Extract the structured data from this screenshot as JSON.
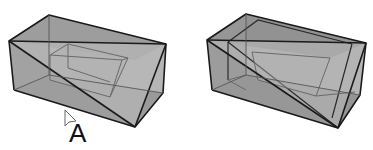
{
  "figure": {
    "panels": [
      {
        "id": "left",
        "label": "A",
        "has_cursor": true
      },
      {
        "id": "right",
        "label": "",
        "has_cursor": false
      }
    ],
    "colors": {
      "face_light": "#b4b4b4",
      "face_mid": "#a2a2a2",
      "face_dark": "#8e8e8e",
      "edge": "#1a1a1a",
      "inner_edge": "#6a6a6a",
      "background": "#ffffff"
    }
  }
}
